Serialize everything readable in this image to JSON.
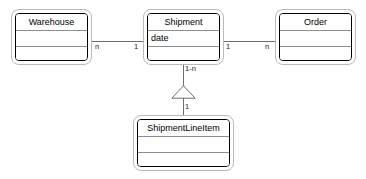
{
  "diagram": {
    "type": "uml-class-diagram",
    "background_color": "#ffffff",
    "line_color": "#6d6d6d",
    "box_border_color": "#000000",
    "box_frame_color": "#b9b9b9",
    "divider_color": "#8e8e8e"
  },
  "classes": [
    {
      "id": "warehouse",
      "name": "Warehouse",
      "attributes": "",
      "operations": ""
    },
    {
      "id": "shipment",
      "name": "Shipment",
      "attributes": "date",
      "operations": ""
    },
    {
      "id": "order",
      "name": "Order",
      "attributes": "",
      "operations": ""
    },
    {
      "id": "shipment_line_item",
      "name": "ShipmentLineItem",
      "attributes": "",
      "operations": ""
    }
  ],
  "relationships": [
    {
      "id": "warehouse_shipment",
      "kind": "association",
      "source": "Warehouse",
      "target": "Shipment",
      "source_multiplicity": "n",
      "target_multiplicity": "1"
    },
    {
      "id": "shipment_order",
      "kind": "association",
      "source": "Shipment",
      "target": "Order",
      "source_multiplicity": "1",
      "target_multiplicity": "n"
    },
    {
      "id": "shipment_lineitem",
      "kind": "generalization",
      "source": "ShipmentLineItem",
      "target": "Shipment",
      "target_multiplicity": "1-n",
      "source_multiplicity": "1"
    }
  ]
}
